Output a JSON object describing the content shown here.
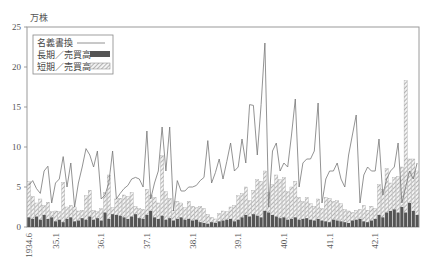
{
  "chart_data": {
    "type": "bar",
    "title": "",
    "ylabel": "万株",
    "xlabel": "",
    "ylim": [
      0,
      25
    ],
    "yticks": [
      0,
      5,
      10,
      15,
      20,
      25
    ],
    "grid": false,
    "legend_position": "upper-left",
    "x_start": "1934.6",
    "x_end": "1942.12",
    "xtick_labels": [
      {
        "label": "1934.6",
        "index": 0
      },
      {
        "label": "35.1",
        "index": 7
      },
      {
        "label": "36.1",
        "index": 19
      },
      {
        "label": "37.1",
        "index": 31
      },
      {
        "label": "38.1",
        "index": 43
      },
      {
        "label": "39.1",
        "index": 55
      },
      {
        "label": "40.1",
        "index": 67
      },
      {
        "label": "41.1",
        "index": 79
      },
      {
        "label": "42.1",
        "index": 91
      }
    ],
    "legend": [
      {
        "name": "名義書換",
        "style": "line"
      },
      {
        "name": "長期／売買高",
        "style": "dark-bar"
      },
      {
        "name": "短期／売買高",
        "style": "hatched-bar"
      }
    ],
    "series": [
      {
        "name": "名義書換",
        "type": "line",
        "values": [
          5.2,
          5.8,
          4.8,
          4.2,
          7.0,
          7.6,
          3.0,
          5.5,
          6.0,
          8.8,
          5.0,
          8.0,
          2.5,
          5.5,
          7.5,
          9.8,
          9.0,
          7.5,
          9.5,
          3.5,
          4.0,
          5.5,
          9.5,
          3.5,
          4.2,
          4.8,
          5.2,
          6.0,
          6.2,
          6.0,
          5.0,
          12.0,
          3.5,
          5.5,
          7.0,
          12.5,
          7.0,
          12.5,
          2.0,
          5.8,
          4.5,
          4.5,
          5.0,
          5.0,
          5.2,
          5.8,
          6.2,
          10.8,
          5.5,
          6.8,
          8.5,
          6.0,
          8.2,
          10.5,
          7.0,
          7.5,
          11.0,
          8.0,
          15.3,
          15.2,
          9.0,
          15.3,
          23.0,
          2.5,
          9.5,
          10.5,
          7.0,
          8.0,
          7.5,
          11.5,
          16.0,
          5.0,
          8.0,
          8.5,
          8.5,
          9.5,
          15.5,
          3.0,
          6.0,
          7.0,
          7.0,
          8.0,
          6.0,
          5.0,
          9.0,
          11.5,
          14.0,
          3.0,
          6.5,
          7.5,
          7.0,
          7.0,
          11.0,
          4.0,
          6.0,
          7.0,
          7.5,
          10.5,
          3.0,
          5.0,
          7.0,
          6.0,
          8.0
        ]
      },
      {
        "name": "長期／売買高",
        "type": "bar",
        "values": [
          1.2,
          1.0,
          1.3,
          0.9,
          1.5,
          1.0,
          1.2,
          0.7,
          0.9,
          0.6,
          1.0,
          1.2,
          0.7,
          0.8,
          1.1,
          0.9,
          1.3,
          0.9,
          1.1,
          0.8,
          1.8,
          1.0,
          1.6,
          1.5,
          1.4,
          1.2,
          1.0,
          1.3,
          1.6,
          1.1,
          1.0,
          1.5,
          2.0,
          1.2,
          1.0,
          1.4,
          0.9,
          1.1,
          0.8,
          1.0,
          1.2,
          0.9,
          1.0,
          0.8,
          0.9,
          0.6,
          0.5,
          0.4,
          0.6,
          0.5,
          0.7,
          0.8,
          0.9,
          1.0,
          0.7,
          0.9,
          1.2,
          1.5,
          1.3,
          1.6,
          1.4,
          1.2,
          2.0,
          1.8,
          1.5,
          1.3,
          1.1,
          1.2,
          0.9,
          1.0,
          1.2,
          0.9,
          1.0,
          1.1,
          0.9,
          0.8,
          1.0,
          0.8,
          0.7,
          0.6,
          0.9,
          0.8,
          0.7,
          0.6,
          0.5,
          0.8,
          0.9,
          1.0,
          0.7,
          0.6,
          0.8,
          1.0,
          1.5,
          1.2,
          1.8,
          2.0,
          2.2,
          1.8,
          2.5,
          1.8,
          3.0,
          2.0,
          1.5
        ]
      },
      {
        "name": "短期／売買高",
        "type": "bar",
        "values": [
          4.5,
          2.8,
          1.7,
          2.6,
          1.2,
          2.1,
          0.7,
          1.3,
          1.0,
          5.0,
          1.5,
          1.5,
          1.8,
          1.2,
          1.0,
          3.0,
          3.3,
          1.2,
          0.8,
          1.5,
          2.5,
          5.5,
          0.8,
          2.0,
          2.2,
          2.8,
          2.8,
          3.0,
          1.0,
          1.2,
          1.2,
          3.2,
          2.0,
          2.5,
          2.0,
          7.5,
          3.5,
          2.5,
          1.3,
          2.2,
          1.8,
          1.5,
          2.2,
          1.8,
          1.5,
          2.0,
          1.8,
          1.2,
          0.6,
          0.5,
          1.0,
          1.2,
          1.0,
          1.5,
          2.0,
          3.0,
          3.0,
          3.5,
          2.0,
          3.0,
          4.5,
          4.5,
          5.0,
          2.5,
          3.8,
          5.2,
          4.8,
          5.0,
          3.5,
          4.0,
          4.5,
          2.8,
          2.2,
          2.6,
          2.0,
          1.8,
          2.5,
          1.5,
          3.0,
          3.0,
          2.3,
          2.5,
          2.2,
          1.6,
          1.5,
          1.0,
          1.2,
          1.2,
          2.0,
          1.5,
          1.8,
          1.3,
          3.8,
          3.5,
          5.5,
          3.5,
          4.0,
          4.5,
          5.0,
          16.5,
          5.5,
          6.5,
          5.5
        ]
      }
    ]
  }
}
